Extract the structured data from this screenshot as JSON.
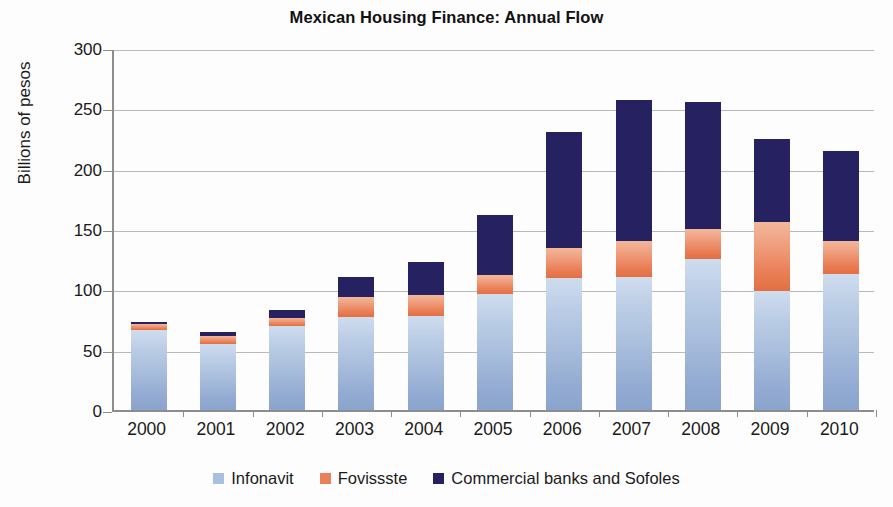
{
  "chart_data": {
    "type": "bar",
    "stacked": true,
    "title": "Mexican Housing Finance: Annual Flow",
    "xlabel": "",
    "ylabel": "Billions of pesos",
    "ylim": [
      0,
      300
    ],
    "yticks": [
      0,
      50,
      100,
      150,
      200,
      250,
      300
    ],
    "ytick_labels": [
      "0",
      "50",
      "100",
      "150",
      "200",
      "250",
      "300"
    ],
    "grid": true,
    "legend_position": "bottom",
    "categories": [
      "2000",
      "2001",
      "2002",
      "2003",
      "2004",
      "2005",
      "2006",
      "2007",
      "2008",
      "2009",
      "2010"
    ],
    "series": [
      {
        "name": "Infonavit",
        "color": "#aabfdd",
        "values": [
          66,
          55,
          70,
          77,
          78,
          96,
          109,
          110,
          125,
          99,
          113
        ]
      },
      {
        "name": "Fovissste",
        "color": "#ea8057",
        "values": [
          5,
          6,
          6,
          17,
          17,
          16,
          25,
          30,
          25,
          57,
          27
        ]
      },
      {
        "name": "Commercial banks and Sofoles",
        "color": "#262262",
        "values": [
          2,
          4,
          7,
          16,
          28,
          50,
          96,
          117,
          105,
          69,
          75
        ]
      }
    ],
    "totals": [
      73,
      65,
      83,
      110,
      123,
      162,
      230,
      257,
      255,
      225,
      215
    ]
  },
  "legend": {
    "items": [
      {
        "label": "Infonavit",
        "color": "#aabfdd"
      },
      {
        "label": "Fovissste",
        "color": "#ea8057"
      },
      {
        "label": "Commercial banks and Sofoles",
        "color": "#262262"
      }
    ]
  }
}
